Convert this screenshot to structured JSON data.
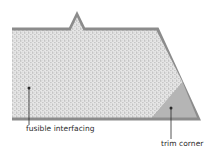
{
  "diagram": {
    "labels": {
      "fusible_interfacing": "fusible interfacing",
      "trim_corner": "trim corner"
    },
    "colors": {
      "background": "#ffffff",
      "outline": "#8c8c8c",
      "interfacing_fill": "#e4e4e4",
      "stipple_dot": "#9a9a9a",
      "trim_corner_fill": "#b5b5b5",
      "leader_line": "#2a2a2a"
    },
    "parts": [
      {
        "name": "fabric-outline",
        "shape": "polygon",
        "notch": "top triangular notch"
      },
      {
        "name": "fusible-interfacing",
        "fill": "stippled"
      },
      {
        "name": "trim-corner",
        "shape": "triangle",
        "fill": "solid gray"
      }
    ]
  }
}
